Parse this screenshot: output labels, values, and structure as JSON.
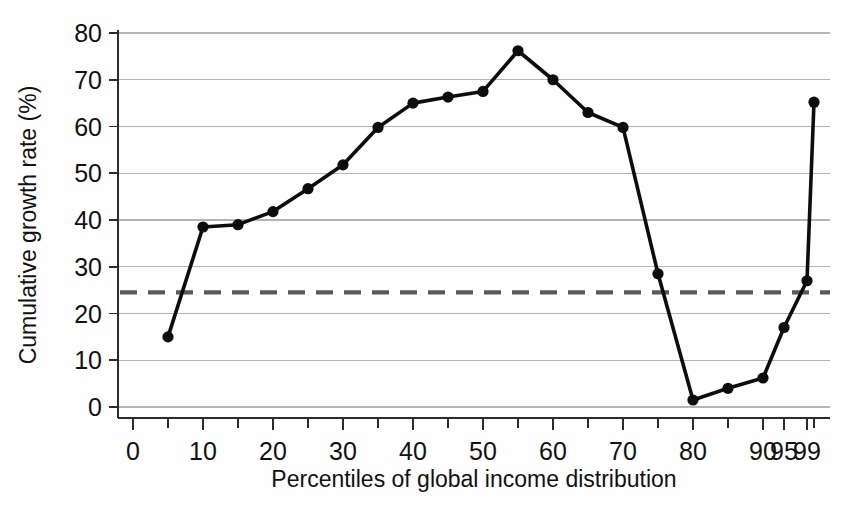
{
  "chart_data": {
    "type": "line",
    "title": "",
    "subtitle": "",
    "xlabel": "Percentiles of global income distribution",
    "ylabel": "Cumulative growth rate (%)",
    "xlim": [
      0,
      100
    ],
    "ylim": [
      0,
      80
    ],
    "grid": "horizontal",
    "legend": "none",
    "x_tick_labels": [
      "0",
      "10",
      "20",
      "30",
      "40",
      "50",
      "60",
      "70",
      "80",
      "90",
      "95",
      "99"
    ],
    "x_tick_values": [
      0,
      10,
      20,
      30,
      40,
      50,
      60,
      70,
      80,
      90,
      95,
      99
    ],
    "x_minor_tick_values": [
      5,
      15,
      25,
      35,
      45,
      55,
      65,
      75,
      85,
      100
    ],
    "y_tick_labels": [
      "0",
      "10",
      "20",
      "30",
      "40",
      "50",
      "60",
      "70",
      "80"
    ],
    "y_tick_values": [
      0,
      10,
      20,
      30,
      40,
      50,
      60,
      70,
      80
    ],
    "series": [
      {
        "name": "Cumulative real income growth 1988-2008",
        "marker": "circle",
        "color": "#0d0d0d",
        "x": [
          5,
          10,
          15,
          20,
          25,
          30,
          35,
          40,
          45,
          50,
          55,
          60,
          65,
          70,
          75,
          80,
          85,
          90,
          95,
          99,
          100
        ],
        "y": [
          15.0,
          38.5,
          39.0,
          41.8,
          46.7,
          51.8,
          59.8,
          65.0,
          66.3,
          67.5,
          76.2,
          70.0,
          63.0,
          59.8,
          28.5,
          1.5,
          4.0,
          6.2,
          17.0,
          27.0,
          65.2
        ]
      }
    ],
    "reference_lines": [
      {
        "name": "global-average-growth",
        "orientation": "horizontal",
        "value": 24.5,
        "style": "dashed",
        "color": "#5a5a5a",
        "label": ""
      }
    ]
  }
}
